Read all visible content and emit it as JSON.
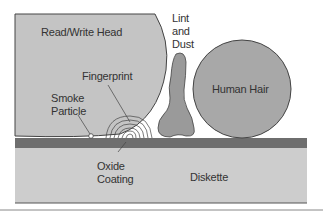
{
  "diagram": {
    "labels": {
      "head": "Read/Write Head",
      "lint_line1": "Lint",
      "lint_line2": "and",
      "lint_line3": "Dust",
      "fingerprint": "Fingerprint",
      "hair": "Human Hair",
      "smoke_line1": "Smoke",
      "smoke_line2": "Particle",
      "oxide_line1": "Oxide",
      "oxide_line2": "Coating",
      "diskette": "Diskette"
    },
    "colors": {
      "head_fill": "#c4c4c4",
      "hair_fill": "#a8a8a8",
      "lint_fill": "#9a9a9a",
      "oxide_fill": "#6e6e6e",
      "diskette_fill": "#cdcdcd",
      "outline": "#444444"
    }
  }
}
